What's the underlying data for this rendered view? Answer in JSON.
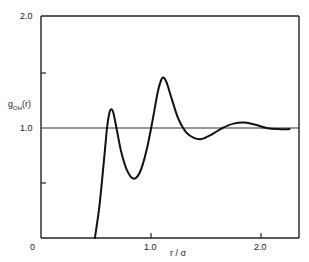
{
  "chart_data": {
    "type": "line",
    "title": "",
    "xlabel": "r / σ",
    "ylabel": "g_OH(r)",
    "ylabel_main": "g",
    "ylabel_sub": "OH",
    "ylabel_arg": "(r)",
    "xlim": [
      0,
      2.35
    ],
    "ylim": [
      0,
      2.0
    ],
    "grid": false,
    "legend": null,
    "x_ticks": [
      {
        "value": 0,
        "label": "0"
      },
      {
        "value": 1.0,
        "label": "1.0"
      },
      {
        "value": 2.0,
        "label": "2.0"
      }
    ],
    "y_ticks": [
      {
        "value": 0.5,
        "label": ""
      },
      {
        "value": 1.0,
        "label": "1.0"
      },
      {
        "value": 1.5,
        "label": ""
      },
      {
        "value": 2.0,
        "label": "2.0"
      }
    ],
    "reference_line": {
      "y": 1.0
    },
    "series": [
      {
        "name": "g_OH(r)",
        "x": [
          0.49,
          0.53,
          0.57,
          0.6,
          0.62,
          0.64,
          0.66,
          0.69,
          0.73,
          0.78,
          0.84,
          0.9,
          0.96,
          1.02,
          1.06,
          1.09,
          1.11,
          1.14,
          1.19,
          1.25,
          1.32,
          1.39,
          1.46,
          1.55,
          1.65,
          1.75,
          1.85,
          1.95,
          2.05,
          2.15,
          2.26
        ],
        "y": [
          0.0,
          0.28,
          0.68,
          1.0,
          1.13,
          1.17,
          1.13,
          0.98,
          0.78,
          0.62,
          0.54,
          0.6,
          0.8,
          1.1,
          1.32,
          1.43,
          1.46,
          1.42,
          1.26,
          1.08,
          0.96,
          0.91,
          0.9,
          0.94,
          1.0,
          1.04,
          1.05,
          1.03,
          1.0,
          0.99,
          0.99
        ]
      }
    ]
  },
  "axis": {
    "x_label_text": "r / σ",
    "y_label_g": "g",
    "y_label_sub": "OH",
    "y_label_arg": "(r)",
    "tick_0": "0",
    "tick_x1": "1.0",
    "tick_x2": "2.0",
    "tick_y1": "1.0",
    "tick_y2": "2.0"
  }
}
